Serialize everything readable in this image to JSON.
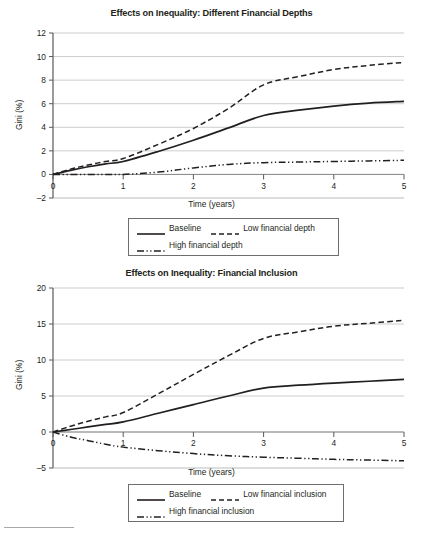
{
  "page": {
    "footer_rule": "footnote-separator-rule"
  },
  "charts": [
    {
      "id": "financial-depths",
      "title": "Effects on Inequality: Different Financial Depths",
      "xlabel": "Time (years)",
      "ylabel": "Gini (%)",
      "xticks": [
        "0",
        "1",
        "2",
        "3",
        "4",
        "5"
      ],
      "yticks": [
        "12",
        "10",
        "8",
        "6",
        "4",
        "2",
        "0",
        "-2"
      ],
      "legend": [
        {
          "label": "Baseline",
          "style": "solid"
        },
        {
          "label": "Low financial depth",
          "style": "dashed"
        },
        {
          "label": "High financial depth",
          "style": "dash-dot-dot"
        }
      ]
    },
    {
      "id": "financial-inclusion",
      "title": "Effects on Inequality: Financial Inclusion",
      "xlabel": "Time (years)",
      "ylabel": "Gini (%)",
      "xticks": [
        "0",
        "1",
        "2",
        "3",
        "4",
        "5"
      ],
      "yticks": [
        "20",
        "15",
        "10",
        "5",
        "0",
        "-5"
      ],
      "legend": [
        {
          "label": "Baseline",
          "style": "solid"
        },
        {
          "label": "Low financial inclusion",
          "style": "dashed"
        },
        {
          "label": "High financial inclusion",
          "style": "dash-dot-dot"
        }
      ]
    }
  ],
  "chart_data": [
    {
      "type": "line",
      "title": "Effects on Inequality: Different Financial Depths",
      "xlabel": "Time (years)",
      "ylabel": "Gini (%)",
      "xlim": [
        0,
        5
      ],
      "ylim": [
        -2,
        12
      ],
      "xticks": [
        0,
        1,
        2,
        3,
        4,
        5
      ],
      "yticks": [
        -2,
        0,
        2,
        4,
        6,
        8,
        10,
        12
      ],
      "grid": "horizontal",
      "legend_position": "below-axis",
      "x": [
        0,
        0.25,
        0.5,
        0.75,
        1,
        1.5,
        2,
        2.5,
        3,
        3.5,
        4,
        4.5,
        5
      ],
      "series": [
        {
          "name": "Baseline",
          "style": "solid",
          "color": "#231f20",
          "values": [
            0,
            0.35,
            0.65,
            0.9,
            1.1,
            1.95,
            2.9,
            3.95,
            5.0,
            5.45,
            5.8,
            6.05,
            6.2
          ]
        },
        {
          "name": "Low financial depth",
          "style": "dashed",
          "color": "#231f20",
          "values": [
            0,
            0.45,
            0.8,
            1.1,
            1.35,
            2.55,
            3.9,
            5.6,
            7.6,
            8.3,
            8.9,
            9.25,
            9.5
          ]
        },
        {
          "name": "High financial depth",
          "style": "dash-dot-dot",
          "color": "#231f20",
          "values": [
            0,
            0,
            0,
            0,
            0,
            0.2,
            0.55,
            0.85,
            1.0,
            1.05,
            1.1,
            1.15,
            1.2
          ]
        }
      ]
    },
    {
      "type": "line",
      "title": "Effects on Inequality: Financial Inclusion",
      "xlabel": "Time (years)",
      "ylabel": "Gini (%)",
      "xlim": [
        0,
        5
      ],
      "ylim": [
        -5,
        20
      ],
      "xticks": [
        0,
        1,
        2,
        3,
        4,
        5
      ],
      "yticks": [
        -5,
        0,
        5,
        10,
        15,
        20
      ],
      "grid": "horizontal",
      "legend_position": "below-axis",
      "x": [
        0,
        0.25,
        0.5,
        0.75,
        1,
        1.5,
        2,
        2.5,
        3,
        3.5,
        4,
        4.5,
        5
      ],
      "series": [
        {
          "name": "Baseline",
          "style": "solid",
          "color": "#231f20",
          "values": [
            0,
            0.35,
            0.7,
            1.05,
            1.4,
            2.6,
            3.8,
            5.0,
            6.1,
            6.5,
            6.8,
            7.05,
            7.3
          ]
        },
        {
          "name": "Low financial inclusion",
          "style": "dashed",
          "color": "#231f20",
          "values": [
            0,
            0.8,
            1.5,
            2.1,
            2.7,
            5.3,
            8.0,
            10.6,
            13.0,
            13.9,
            14.7,
            15.1,
            15.5
          ]
        },
        {
          "name": "High financial inclusion",
          "style": "dash-dot-dot",
          "color": "#231f20",
          "values": [
            0,
            -0.7,
            -1.2,
            -1.7,
            -2.1,
            -2.6,
            -3.0,
            -3.3,
            -3.5,
            -3.65,
            -3.8,
            -3.9,
            -4.0
          ]
        }
      ]
    }
  ]
}
